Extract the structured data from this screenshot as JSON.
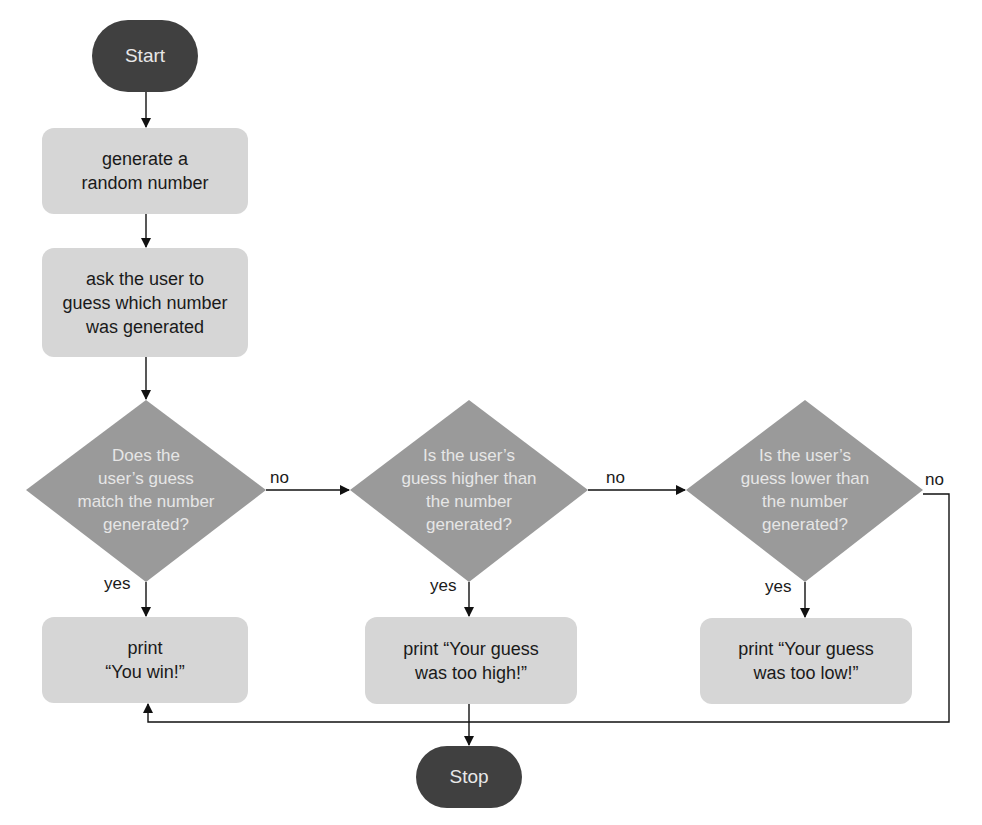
{
  "diagram": {
    "type": "flowchart",
    "colors": {
      "terminal": "#404040",
      "process": "#d6d6d6",
      "decision": "#9a9a9a",
      "line": "#111111"
    },
    "nodes": {
      "start": {
        "label": "Start"
      },
      "generate": {
        "label_line1": "generate a",
        "label_line2": "random number"
      },
      "ask": {
        "label_line1": "ask the user to",
        "label_line2": "guess which number",
        "label_line3": "was generated"
      },
      "match": {
        "label_line1": "Does the",
        "label_line2": "user’s guess",
        "label_line3": "match the number",
        "label_line4": "generated?"
      },
      "higher": {
        "label_line1": "Is the user’s",
        "label_line2": "guess higher than",
        "label_line3": "the number",
        "label_line4": "generated?"
      },
      "lower": {
        "label_line1": "Is the user’s",
        "label_line2": "guess lower than",
        "label_line3": "the number",
        "label_line4": "generated?"
      },
      "win": {
        "label_line1": "print",
        "label_line2": "“You win!”"
      },
      "too_high": {
        "label_line1": "print “Your guess",
        "label_line2": "was too high!”"
      },
      "too_low": {
        "label_line1": "print “Your guess",
        "label_line2": "was too low!”"
      },
      "stop": {
        "label": "Stop"
      }
    },
    "edge_labels": {
      "match_no": "no",
      "match_yes": "yes",
      "higher_no": "no",
      "higher_yes": "yes",
      "lower_no": "no",
      "lower_yes": "yes"
    },
    "edges": [
      {
        "from": "start",
        "to": "generate"
      },
      {
        "from": "generate",
        "to": "ask"
      },
      {
        "from": "ask",
        "to": "match"
      },
      {
        "from": "match",
        "to": "win",
        "label": "yes"
      },
      {
        "from": "match",
        "to": "higher",
        "label": "no"
      },
      {
        "from": "higher",
        "to": "too_high",
        "label": "yes"
      },
      {
        "from": "higher",
        "to": "lower",
        "label": "no"
      },
      {
        "from": "lower",
        "to": "too_low",
        "label": "yes"
      },
      {
        "from": "lower",
        "to": "win",
        "label": "no"
      },
      {
        "from": "too_high",
        "to": "stop"
      }
    ]
  }
}
